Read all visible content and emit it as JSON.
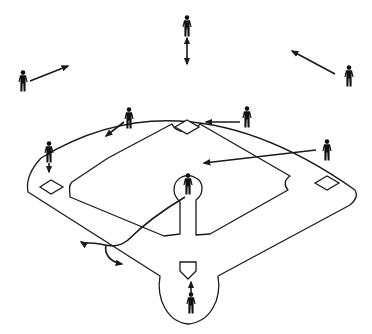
{
  "diagram": {
    "title": "",
    "type": "baseball-field-defensive-positions",
    "colors": {
      "line": "#1a1a1a",
      "player": "#111111",
      "background": "#ffffff"
    },
    "field": {
      "outfield_arc": "M 41 158 Q 185 70 355 190",
      "infield_outline": "M 41 158 L 78 194 L 183 252 L 183 192 L 183 185 M 187 185 L 187 252 L 290 196 L 355 190",
      "outer_path": "M 41 158 C 30 170 26 182 28 192 L 160 276 C 156 300 168 322 188 324 C 210 322 222 300 218 276 L 350 205 C 356 200 358 195 355 190",
      "inner_left_path": "M 70 197 C 70 190 68 186 72 182 L 108 158 L 172 124 C 176 134 194 134 200 124 L 290 176 C 284 180 284 186 288 190 L 210 234 L 196 235 L 196 200 C 204 194 204 182 196 178 C 186 172 174 178 174 190 C 174 196 178 200 180 202 L 180 234 L 164 236 L 70 197 Z",
      "bases": [
        {
          "name": "second-base",
          "points": "175,127 187,120 199,127 187,134"
        },
        {
          "name": "first-base",
          "points": "315,183 327,176 339,183 327,190"
        },
        {
          "name": "third-base",
          "points": "40,187 51,180 63,187 51,194"
        },
        {
          "name": "home-plate",
          "points": "180,262 196,262 196,271 188,279 180,271"
        }
      ]
    },
    "players": [
      {
        "name": "left-fielder",
        "x": 23,
        "y": 81
      },
      {
        "name": "center-fielder",
        "x": 187,
        "y": 26
      },
      {
        "name": "right-fielder",
        "x": 349,
        "y": 76
      },
      {
        "name": "shortstop",
        "x": 129,
        "y": 118
      },
      {
        "name": "second-baseman",
        "x": 247,
        "y": 117
      },
      {
        "name": "third-baseman",
        "x": 49,
        "y": 152
      },
      {
        "name": "first-baseman",
        "x": 327,
        "y": 150
      },
      {
        "name": "pitcher",
        "x": 188,
        "y": 184
      },
      {
        "name": "catcher",
        "x": 191,
        "y": 303
      }
    ],
    "arrows": [
      {
        "name": "left-fielder-arrow",
        "d": "M 30 81 L 68 66",
        "head": "end"
      },
      {
        "name": "center-fielder-arrow",
        "d": "M 187 38 L 187 64",
        "head": "both"
      },
      {
        "name": "right-fielder-arrow",
        "d": "M 335 74 L 292 51",
        "head": "end"
      },
      {
        "name": "shortstop-arrow",
        "d": "M 124 122 L 106 136",
        "head": "end"
      },
      {
        "name": "second-baseman-arrow",
        "d": "M 240 122 L 206 122",
        "head": "end"
      },
      {
        "name": "third-baseman-arrow",
        "d": "M 49 163 L 49 172",
        "head": "end"
      },
      {
        "name": "first-baseman-arrow",
        "d": "M 316 150 L 204 163",
        "head": "end"
      },
      {
        "name": "catcher-arrow",
        "d": "M 191 294 L 191 282",
        "head": "end"
      },
      {
        "name": "batted-ball-path",
        "d": "M 185 197 C 160 212 140 228 128 240 C 118 248 110 246 100 244 C 90 242 84 244 81 242",
        "head": "end"
      },
      {
        "name": "batted-ball-branch",
        "d": "M 106 245 C 104 254 110 262 122 264",
        "head": "end"
      }
    ]
  }
}
